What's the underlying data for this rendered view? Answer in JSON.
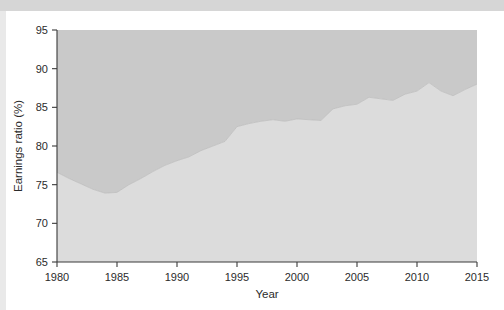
{
  "figure": {
    "background_color": "#ffffff",
    "top_band_color": "#d6d6d6",
    "left_band_color": "#e9e9e9"
  },
  "chart_data": {
    "type": "area",
    "title": "",
    "subtitle": "",
    "xlabel": "Year",
    "ylabel": "Earnings ratio (%)",
    "xlim": [
      1980,
      2015
    ],
    "ylim": [
      65,
      95
    ],
    "xticks": [
      1980,
      1985,
      1990,
      1995,
      2000,
      2005,
      2010,
      2015
    ],
    "xticklabels": [
      "1980",
      "1985",
      "1990",
      "1995",
      "2000",
      "2005",
      "2010",
      "2015"
    ],
    "yticks": [
      65,
      70,
      75,
      80,
      85,
      90,
      95
    ],
    "yticklabels": [
      "65",
      "70",
      "75",
      "80",
      "85",
      "90",
      "95"
    ],
    "grid": false,
    "legend": "none",
    "colors": {
      "upper_fill": "#c9c9c9",
      "lower_fill": "#dcdcdc",
      "axis": "#3a3a3a",
      "text": "#2b2b2b"
    },
    "x": [
      1980,
      1981,
      1982,
      1983,
      1984,
      1985,
      1986,
      1987,
      1988,
      1989,
      1990,
      1991,
      1992,
      1993,
      1994,
      1995,
      1996,
      1997,
      1998,
      1999,
      2000,
      2001,
      2002,
      2003,
      2004,
      2005,
      2006,
      2007,
      2008,
      2009,
      2010,
      2011,
      2012,
      2013,
      2014,
      2015
    ],
    "series": [
      {
        "name": "Earnings ratio",
        "values": [
          76.6,
          75.8,
          75.1,
          74.4,
          73.9,
          74.0,
          75.0,
          75.8,
          76.7,
          77.5,
          78.1,
          78.6,
          79.4,
          80.0,
          80.6,
          82.5,
          82.9,
          83.2,
          83.4,
          83.2,
          83.5,
          83.4,
          83.3,
          84.8,
          85.2,
          85.4,
          86.3,
          86.1,
          85.9,
          86.7,
          87.1,
          88.2,
          87.1,
          86.5,
          87.3,
          88.0
        ]
      }
    ]
  },
  "axes": {
    "x_axis_label": "Year",
    "y_axis_label": "Earnings ratio (%)"
  }
}
